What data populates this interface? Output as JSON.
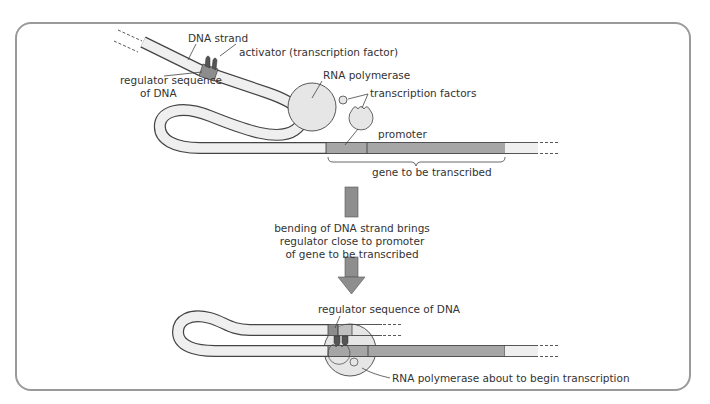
{
  "colors": {
    "border": "#9a9a9a",
    "strand_fill": "#efefef",
    "strand_outline": "#444444",
    "gene_fill": "#a6a6a6",
    "regulator_fill": "#8c8c8c",
    "activator_fill": "#555555",
    "polymerase_fill": "#e6e6e6",
    "arrow_fill": "#8e8e8e",
    "text": "#333333"
  },
  "top_panel": {
    "labels": {
      "dna_strand": "DNA strand",
      "activator": "activator (transcription factor)",
      "regulator_line1": "regulator sequence",
      "regulator_line2": "of DNA",
      "rna_polymerase": "RNA polymerase",
      "transcription_factors": "transcription factors",
      "promoter": "promoter",
      "gene": "gene to be transcribed"
    }
  },
  "transition": {
    "caption_line1": "bending of DNA strand brings",
    "caption_line2": "regulator close to promoter",
    "caption_line3": "of gene to be transcribed"
  },
  "bottom_panel": {
    "labels": {
      "regulator": "regulator sequence of DNA",
      "polymerase": "RNA polymerase about to begin transcription"
    }
  }
}
